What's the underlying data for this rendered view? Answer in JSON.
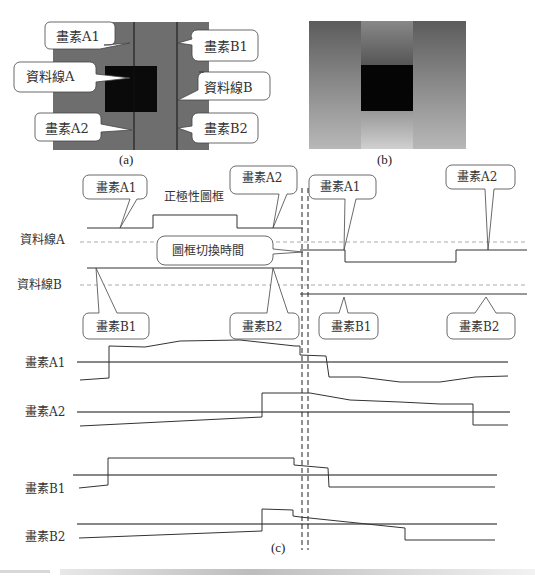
{
  "panel_a": {
    "caption": "(a)",
    "callouts": {
      "pixel_a1": "畫素A1",
      "pixel_b1": "畫素B1",
      "data_line_a": "資料線A",
      "data_line_b": "資料線B",
      "pixel_a2": "畫素A2",
      "pixel_b2": "畫素B2"
    },
    "colors": {
      "background": "#6e6e6e",
      "square": "#0a0a0a",
      "line": "#111111"
    }
  },
  "panel_b": {
    "caption": "(b)",
    "colors": {
      "top": "#5a5a5a",
      "bottom": "#bdbdbd",
      "square": "#050505"
    }
  },
  "panel_c": {
    "caption": "(c)",
    "labels": {
      "positive_frame": "正極性圖框",
      "frame_switch_time": "圖框切換時間",
      "data_line_a": "資料線A",
      "data_line_b": "資料線B",
      "pixel_a1": "畫素A1",
      "pixel_a2": "畫素A2",
      "pixel_b1": "畫素B1",
      "pixel_b2": "畫素B2"
    },
    "callouts_top": [
      "畫素A1",
      "畫素A2",
      "畫素A1",
      "畫素A2"
    ],
    "callouts_bottom": [
      "畫素B1",
      "畫素B2",
      "畫素B1",
      "畫素B2"
    ]
  }
}
